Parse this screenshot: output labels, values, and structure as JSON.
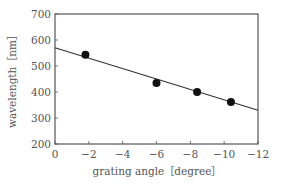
{
  "chart_data": {
    "type": "scatter",
    "title": "",
    "xlabel": "grating angle［degree］",
    "ylabel": "wavelength［nm］",
    "xlim": [
      0,
      -12
    ],
    "ylim": [
      200,
      700
    ],
    "x_ticks": [
      0,
      -2,
      -4,
      -6,
      -8,
      -10,
      -12
    ],
    "x_tick_labels": [
      "0",
      "−2",
      "−4",
      "−6",
      "−8",
      "−10",
      "−12"
    ],
    "y_ticks": [
      200,
      300,
      400,
      500,
      600,
      700
    ],
    "y_tick_labels": [
      "200",
      "300",
      "400",
      "500",
      "600",
      "700"
    ],
    "grid": false,
    "legend": null,
    "series": [
      {
        "name": "measured",
        "type": "scatter",
        "marker": "filled-circle",
        "color": "#111111",
        "x": [
          -1.8,
          -6.0,
          -8.4,
          -10.4
        ],
        "y": [
          543,
          435,
          400,
          362
        ]
      },
      {
        "name": "linear fit",
        "type": "line",
        "color": "#333333",
        "x": [
          0,
          -12
        ],
        "y": [
          570,
          330
        ]
      }
    ]
  },
  "colors": {
    "axis": "#555555",
    "text": "#555555",
    "marker": "#111111",
    "line": "#333333"
  }
}
